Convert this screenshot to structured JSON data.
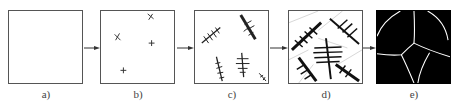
{
  "figure": {
    "colors": {
      "stroke": "#222222",
      "border": "#555555",
      "grain_fill": "#000000",
      "boundary": "#ffffff",
      "label": "#444444"
    },
    "panels": [
      {
        "id": "a",
        "label": "a)",
        "content": "empty liquid"
      },
      {
        "id": "b",
        "label": "b)",
        "content": "nuclei"
      },
      {
        "id": "c",
        "label": "c)",
        "content": "growing dendrites"
      },
      {
        "id": "d",
        "label": "d)",
        "content": "impinging dendrites"
      },
      {
        "id": "e",
        "label": "e)",
        "content": "grains with boundaries"
      }
    ],
    "arrows": 4
  }
}
